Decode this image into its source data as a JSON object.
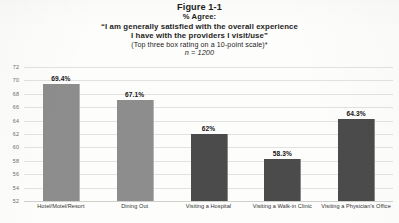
{
  "title_block": {
    "figure_number": "Figure 1-1",
    "agree_line": "% Agree:",
    "quote_line_1": "“I am generally satisfied with the overall experience",
    "quote_line_2": "I have with the providers I visit/use”",
    "scale_note": "(Top three box rating on a 10-point scale)*",
    "sample_size": "n = 1200"
  },
  "chart_data": {
    "type": "bar",
    "title": "Figure 1-1",
    "subtitle": "% Agree: “I am generally satisfied with the overall experience I have with the providers I visit/use”",
    "annotations": [
      "(Top three box rating on a 10-point scale)*",
      "n = 1200"
    ],
    "categories": [
      "Hotel/Motel/Resort",
      "Dining Out",
      "Visiting a Hospital",
      "Visiting a Walk-in Clinic",
      "Visiting a Physician's Office"
    ],
    "values": [
      69.4,
      67.1,
      62.0,
      58.3,
      64.3
    ],
    "value_labels": [
      "69.4%",
      "67.1%",
      "62%",
      "58.3%",
      "64.3%"
    ],
    "bar_colors": [
      "#8d8d8d",
      "#8d8d8d",
      "#4b4b4b",
      "#4b4b4b",
      "#4b4b4b"
    ],
    "xlabel": "",
    "ylabel": "",
    "ylim": [
      52,
      72
    ],
    "yticks": [
      52,
      54,
      56,
      58,
      60,
      62,
      64,
      66,
      68,
      70,
      72
    ],
    "ytick_labels": [
      "52",
      "54",
      "56",
      "58",
      "60",
      "62",
      "64",
      "66",
      "68",
      "70",
      "72"
    ],
    "grid": true,
    "legend": false
  }
}
